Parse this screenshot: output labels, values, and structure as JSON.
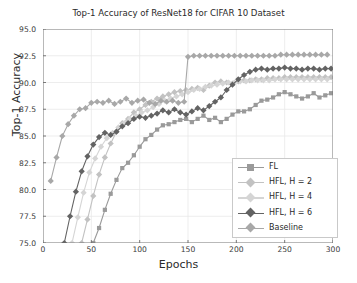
{
  "chart_data": {
    "type": "line",
    "title": "Top-1 Accuracy of ResNet18 for CIFAR 10 Dataset",
    "xlabel": "Epochs",
    "ylabel": "Top-1 Accuracy",
    "xlim": [
      0,
      300
    ],
    "ylim": [
      75.0,
      95.0
    ],
    "xticks": [
      0,
      50,
      100,
      150,
      200,
      250,
      300
    ],
    "yticks": [
      75.0,
      77.5,
      80.0,
      82.5,
      85.0,
      87.5,
      90.0,
      92.5,
      95.0
    ],
    "grid": true,
    "legend_position": "lower right",
    "series": [
      {
        "name": "FL",
        "color": "#9a9a9a",
        "marker": "square",
        "x": [
          52,
          58,
          64,
          70,
          76,
          82,
          88,
          94,
          100,
          106,
          112,
          118,
          124,
          130,
          136,
          142,
          148,
          154,
          160,
          166,
          172,
          178,
          184,
          190,
          196,
          202,
          208,
          214,
          220,
          226,
          232,
          238,
          244,
          250,
          256,
          262,
          268,
          274,
          280,
          286,
          292,
          298
        ],
        "y": [
          75.0,
          76.4,
          78.1,
          79.6,
          80.9,
          82.0,
          82.5,
          83.2,
          84.0,
          84.7,
          85.1,
          85.6,
          86.0,
          86.1,
          86.3,
          86.5,
          86.6,
          86.3,
          86.6,
          86.9,
          86.5,
          86.7,
          86.3,
          86.6,
          87.0,
          87.3,
          87.3,
          87.5,
          87.9,
          88.3,
          88.4,
          88.6,
          88.9,
          89.1,
          88.9,
          88.7,
          88.5,
          88.7,
          89.0,
          88.6,
          88.8,
          89.0
        ]
      },
      {
        "name": "HFL, H = 2",
        "color": "#c2c2c2",
        "marker": "diamond",
        "x": [
          40,
          46,
          52,
          58,
          64,
          70,
          76,
          82,
          88,
          94,
          100,
          106,
          112,
          118,
          124,
          130,
          136,
          142,
          148,
          154,
          160,
          166,
          172,
          178,
          184,
          190,
          196,
          202,
          208,
          214,
          220,
          226,
          232,
          238,
          244,
          250,
          256,
          262,
          268,
          274,
          280,
          286,
          292,
          298
        ],
        "y": [
          75.0,
          77.2,
          79.4,
          81.4,
          83.0,
          84.3,
          85.4,
          86.2,
          86.6,
          87.2,
          87.5,
          87.9,
          88.2,
          88.5,
          88.7,
          88.9,
          89.1,
          89.2,
          89.3,
          89.4,
          89.5,
          89.3,
          89.7,
          90.0,
          90.1,
          90.0,
          89.9,
          90.1,
          90.2,
          90.2,
          90.3,
          90.3,
          90.4,
          90.4,
          90.4,
          90.5,
          90.5,
          90.5,
          90.5,
          90.5,
          90.5,
          90.5,
          90.5,
          90.5
        ]
      },
      {
        "name": "HFL, H = 4",
        "color": "#d5d5d5",
        "marker": "diamond",
        "x": [
          30,
          36,
          42,
          48,
          54,
          60,
          66,
          72,
          78,
          84,
          90,
          96,
          102,
          108,
          114,
          120,
          126,
          132,
          138,
          144,
          150,
          156,
          162,
          168,
          174,
          180,
          186,
          192,
          198,
          204,
          210,
          216,
          222,
          228,
          234,
          240,
          246,
          252,
          258,
          264,
          270,
          276,
          282,
          288,
          294
        ],
        "y": [
          75.0,
          77.4,
          79.7,
          81.6,
          82.9,
          84.0,
          84.8,
          85.3,
          85.8,
          86.2,
          86.6,
          86.9,
          87.2,
          87.4,
          87.7,
          88.0,
          88.3,
          88.5,
          88.7,
          88.9,
          89.1,
          89.3,
          89.4,
          89.6,
          89.7,
          89.8,
          89.9,
          90.0,
          90.0,
          90.1,
          90.1,
          90.2,
          90.2,
          90.2,
          90.2,
          90.3,
          90.3,
          90.3,
          90.3,
          90.3,
          90.3,
          90.3,
          90.3,
          90.3,
          90.3
        ]
      },
      {
        "name": "HFL, H = 6",
        "color": "#636363",
        "marker": "diamond",
        "x": [
          22,
          28,
          34,
          40,
          46,
          52,
          58,
          64,
          70,
          76,
          82,
          88,
          94,
          100,
          106,
          112,
          118,
          124,
          130,
          136,
          142,
          148,
          154,
          160,
          166,
          172,
          178,
          184,
          190,
          196,
          202,
          208,
          214,
          220,
          226,
          232,
          238,
          244,
          250,
          256,
          262,
          268,
          274,
          280,
          286,
          292,
          298
        ],
        "y": [
          75.0,
          77.5,
          79.8,
          81.7,
          83.1,
          84.2,
          84.9,
          85.3,
          85.1,
          85.4,
          85.9,
          86.2,
          86.6,
          86.8,
          86.7,
          86.9,
          87.1,
          87.4,
          87.2,
          87.5,
          87.2,
          87.0,
          87.3,
          87.6,
          87.4,
          87.8,
          88.2,
          88.6,
          89.3,
          89.8,
          90.3,
          90.7,
          91.0,
          91.2,
          91.3,
          91.2,
          91.3,
          91.3,
          91.4,
          91.3,
          91.3,
          91.2,
          91.3,
          91.3,
          91.2,
          91.3,
          91.3
        ]
      },
      {
        "name": "Baseline",
        "color": "#a8a8a8",
        "marker": "diamond",
        "x": [
          8,
          14,
          20,
          26,
          32,
          38,
          44,
          50,
          56,
          62,
          68,
          74,
          80,
          86,
          92,
          98,
          104,
          110,
          116,
          122,
          128,
          134,
          140,
          146,
          150,
          156,
          162,
          168,
          174,
          180,
          186,
          192,
          198,
          204,
          210,
          216,
          222,
          228,
          234,
          240,
          246,
          252,
          258,
          264,
          270,
          276,
          282,
          288,
          294
        ],
        "y": [
          80.8,
          83.0,
          85.0,
          86.1,
          86.9,
          87.5,
          87.6,
          88.1,
          88.2,
          88.1,
          88.3,
          88.0,
          88.2,
          88.5,
          88.1,
          88.3,
          88.4,
          88.1,
          88.0,
          88.3,
          88.2,
          88.3,
          88.1,
          88.2,
          92.4,
          92.5,
          92.5,
          92.5,
          92.5,
          92.5,
          92.5,
          92.5,
          92.5,
          92.5,
          92.5,
          92.5,
          92.5,
          92.5,
          92.5,
          92.5,
          92.6,
          92.6,
          92.6,
          92.6,
          92.6,
          92.6,
          92.6,
          92.6,
          92.6
        ]
      }
    ]
  },
  "legend": {
    "items": [
      {
        "label": "FL"
      },
      {
        "label": "HFL, H = 2"
      },
      {
        "label": "HFL, H = 4"
      },
      {
        "label": "HFL, H = 6"
      },
      {
        "label": "Baseline"
      }
    ]
  },
  "style": {
    "grid_color": "#e8e8e8",
    "axis_color": "#6e6e6e",
    "text_color": "#2a2a2a",
    "background": "#ffffff"
  }
}
